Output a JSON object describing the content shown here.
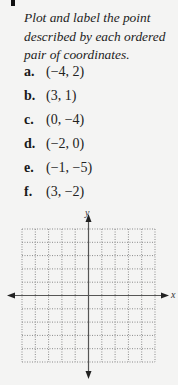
{
  "exercise": {
    "prompt": "Plot and label the point described by each ordered pair of coordinates.",
    "items": [
      {
        "label": "a.",
        "value": "(−4, 2)"
      },
      {
        "label": "b.",
        "value": "(3, 1)"
      },
      {
        "label": "c.",
        "value": "(0, −4)"
      },
      {
        "label": "d.",
        "value": "(−2, 0)"
      },
      {
        "label": "e.",
        "value": "(−1, −5)"
      },
      {
        "label": "f.",
        "value": "(3, −2)"
      }
    ]
  },
  "graph": {
    "x_axis_label": "x",
    "y_axis_label": "y",
    "grid": {
      "columns": 10,
      "rows": 10,
      "style": "dotted"
    },
    "x_range": [
      -5,
      5
    ],
    "y_range": [
      -5,
      5
    ],
    "colors": {
      "axis": "#555555",
      "grid": "#8a8a8a"
    }
  }
}
